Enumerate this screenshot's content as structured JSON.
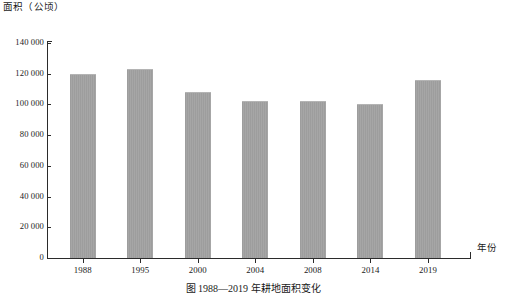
{
  "chart_data": {
    "type": "bar",
    "title": "",
    "caption": "图 1988—2019 年耕地面积变化",
    "xlabel": "年份",
    "ylabel": "面积（公顷）",
    "categories": [
      "1988",
      "1995",
      "2000",
      "2004",
      "2008",
      "2014",
      "2019"
    ],
    "values": [
      120000,
      123000,
      108000,
      102000,
      102000,
      100000,
      116000
    ],
    "ylim": [
      0,
      140000
    ],
    "y_ticks": [
      0,
      20000,
      40000,
      60000,
      80000,
      100000,
      120000,
      140000
    ],
    "y_tick_labels": [
      "0",
      "20 000",
      "40 000",
      "60 000",
      "80 000",
      "100 000",
      "120 000",
      "140 000"
    ],
    "grid": false,
    "legend": null,
    "bar_color": "#9d9d9d",
    "axis_color": "#2b2b2b"
  }
}
